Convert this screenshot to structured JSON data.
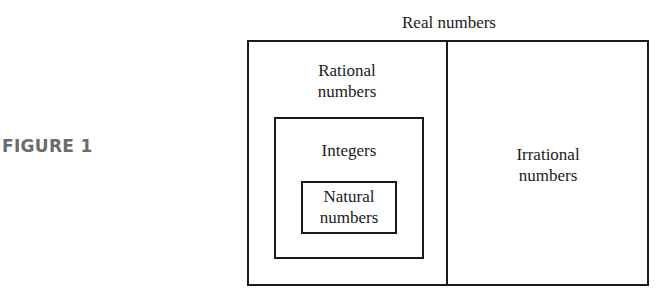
{
  "figure": {
    "label": "FIGURE 1"
  },
  "diagram": {
    "title": "Real numbers",
    "sets": {
      "rational": {
        "line1": "Rational",
        "line2": "numbers"
      },
      "integers": {
        "label": "Integers"
      },
      "natural": {
        "line1": "Natural",
        "line2": "numbers"
      },
      "irrational": {
        "line1": "Irrational",
        "line2": "numbers"
      }
    }
  }
}
